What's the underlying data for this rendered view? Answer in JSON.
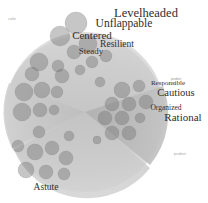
{
  "chart_data": {
    "type": "scatter",
    "title": "",
    "subtitle": "",
    "xlabel": "",
    "ylabel": "",
    "grid": false,
    "legend_position": "none",
    "background": {
      "disc_center_x": 85,
      "disc_center_y": 112,
      "disc_radius": 80,
      "wedges": [
        {
          "name": "upper",
          "start_deg": 200,
          "end_deg": 340,
          "shade": "#cfcfcf"
        },
        {
          "name": "right",
          "start_deg": 340,
          "end_deg": 20,
          "shade": "#b4b4b4"
        },
        {
          "name": "lower",
          "start_deg": 20,
          "end_deg": 160,
          "shade": "#c9c9c9"
        },
        {
          "name": "left",
          "start_deg": 160,
          "end_deg": 200,
          "shade": "#c0c0c0"
        }
      ]
    },
    "words": [
      {
        "label": "Levelheaded",
        "x": 146,
        "y": 13,
        "size": 12.5
      },
      {
        "label": "Unflappable",
        "x": 124,
        "y": 24,
        "size": 11.5
      },
      {
        "label": "Centered",
        "x": 92,
        "y": 35,
        "size": 11.0
      },
      {
        "label": "Resilient",
        "x": 117,
        "y": 45,
        "size": 9.5
      },
      {
        "label": "Steady",
        "x": 91,
        "y": 51,
        "size": 9.0
      },
      {
        "label": "Responsible",
        "x": 168,
        "y": 83,
        "size": 7.0
      },
      {
        "label": "Cautious",
        "x": 176,
        "y": 93,
        "size": 10.5
      },
      {
        "label": "Organized",
        "x": 166,
        "y": 108,
        "size": 7.5
      },
      {
        "label": "Rational",
        "x": 183,
        "y": 117,
        "size": 11.0
      },
      {
        "label": "Astute",
        "x": 46,
        "y": 188,
        "size": 9.5
      }
    ],
    "corner_labels": [
      {
        "position": "top-left",
        "x": 12,
        "y": 20,
        "text": "calm"
      },
      {
        "position": "bottom-right",
        "x": 180,
        "y": 155,
        "text": "prudent"
      }
    ],
    "micro_labels": [
      {
        "x": 176,
        "y": 79,
        "text": "prudent"
      }
    ],
    "bubbles": [
      {
        "cx": 76,
        "cy": 23,
        "r": 11
      },
      {
        "cx": 60,
        "cy": 36,
        "r": 10
      },
      {
        "cx": 88,
        "cy": 44,
        "r": 9
      },
      {
        "cx": 74,
        "cy": 52,
        "r": 7
      },
      {
        "cx": 39,
        "cy": 62,
        "r": 9
      },
      {
        "cx": 58,
        "cy": 66,
        "r": 6
      },
      {
        "cx": 32,
        "cy": 74,
        "r": 7
      },
      {
        "cx": 62,
        "cy": 76,
        "r": 7
      },
      {
        "cx": 80,
        "cy": 70,
        "r": 5
      },
      {
        "cx": 24,
        "cy": 92,
        "r": 9
      },
      {
        "cx": 42,
        "cy": 90,
        "r": 8
      },
      {
        "cx": 57,
        "cy": 92,
        "r": 6
      },
      {
        "cx": 100,
        "cy": 82,
        "r": 5
      },
      {
        "cx": 22,
        "cy": 112,
        "r": 9
      },
      {
        "cx": 40,
        "cy": 110,
        "r": 7
      },
      {
        "cx": 54,
        "cy": 110,
        "r": 5
      },
      {
        "cx": 122,
        "cy": 90,
        "r": 8
      },
      {
        "cx": 139,
        "cy": 86,
        "r": 6
      },
      {
        "cx": 112,
        "cy": 104,
        "r": 7
      },
      {
        "cx": 129,
        "cy": 104,
        "r": 7
      },
      {
        "cx": 146,
        "cy": 102,
        "r": 7
      },
      {
        "cx": 105,
        "cy": 118,
        "r": 7
      },
      {
        "cx": 122,
        "cy": 118,
        "r": 7
      },
      {
        "cx": 140,
        "cy": 118,
        "r": 5
      },
      {
        "cx": 112,
        "cy": 133,
        "r": 7
      },
      {
        "cx": 129,
        "cy": 133,
        "r": 7
      },
      {
        "cx": 97,
        "cy": 140,
        "r": 4
      },
      {
        "cx": 39,
        "cy": 132,
        "r": 6
      },
      {
        "cx": 69,
        "cy": 136,
        "r": 5
      },
      {
        "cx": 18,
        "cy": 146,
        "r": 6
      },
      {
        "cx": 35,
        "cy": 152,
        "r": 8
      },
      {
        "cx": 52,
        "cy": 148,
        "r": 7
      },
      {
        "cx": 66,
        "cy": 158,
        "r": 7
      },
      {
        "cx": 26,
        "cy": 170,
        "r": 8
      },
      {
        "cx": 46,
        "cy": 172,
        "r": 7
      },
      {
        "cx": 64,
        "cy": 174,
        "r": 6
      },
      {
        "cx": 92,
        "cy": 62,
        "r": 6
      },
      {
        "cx": 106,
        "cy": 56,
        "r": 6
      }
    ]
  }
}
